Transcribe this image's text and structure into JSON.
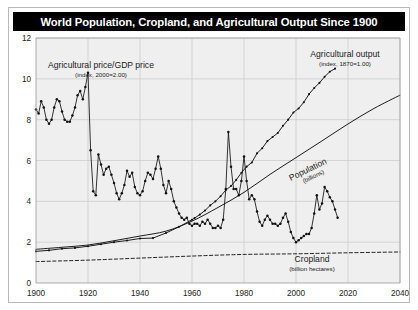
{
  "figure": {
    "title": "World Population, Cropland, and Agricultural Output Since 1900",
    "background": "#ffffff",
    "title_background": "#000000",
    "title_color": "#ffffff",
    "plot_background": "#efefef",
    "grid_color": "#c8c8c8",
    "axis_color": "#9a9a9a",
    "series_color": "#111111"
  },
  "annotations": {
    "price": {
      "line1": "Agricultural price/GDP price",
      "line2": "(index, 2000=2.00)"
    },
    "output": {
      "line1": "Agricultural output",
      "line2": "(index, 1870=1.00)"
    },
    "population": {
      "line1": "Population",
      "line2": "(billions)"
    },
    "cropland": {
      "line1": "Cropland",
      "line2": "(billion hectares)"
    }
  },
  "chart_data": {
    "type": "line",
    "title": "World Population, Cropland, and Agricultural Output Since 1900",
    "xlabel": "",
    "ylabel": "",
    "xlim": [
      1900,
      2040
    ],
    "ylim": [
      0,
      12
    ],
    "xticks": [
      1900,
      1920,
      1940,
      1960,
      1980,
      2000,
      2020,
      2040
    ],
    "yticks": [
      0,
      2,
      4,
      6,
      8,
      10,
      12
    ],
    "grid": true,
    "legend": "inline-annotations",
    "series": [
      {
        "name": "Agricultural price/GDP price",
        "units": "index, 2000=2.00",
        "style": "line-with-markers",
        "color": "#111111",
        "x": [
          1900,
          1901,
          1902,
          1903,
          1904,
          1905,
          1906,
          1907,
          1908,
          1909,
          1910,
          1911,
          1912,
          1913,
          1914,
          1915,
          1916,
          1917,
          1918,
          1919,
          1920,
          1921,
          1922,
          1923,
          1924,
          1925,
          1926,
          1927,
          1928,
          1929,
          1930,
          1931,
          1932,
          1933,
          1934,
          1935,
          1936,
          1937,
          1938,
          1939,
          1940,
          1941,
          1942,
          1943,
          1944,
          1945,
          1946,
          1947,
          1948,
          1949,
          1950,
          1951,
          1952,
          1953,
          1954,
          1955,
          1956,
          1957,
          1958,
          1959,
          1960,
          1961,
          1962,
          1963,
          1964,
          1965,
          1966,
          1967,
          1968,
          1969,
          1970,
          1971,
          1972,
          1973,
          1974,
          1975,
          1976,
          1977,
          1978,
          1979,
          1980,
          1981,
          1982,
          1983,
          1984,
          1985,
          1986,
          1987,
          1988,
          1989,
          1990,
          1991,
          1992,
          1993,
          1994,
          1995,
          1996,
          1997,
          1998,
          1999,
          2000,
          2001,
          2002,
          2003,
          2004,
          2005,
          2006,
          2007,
          2008,
          2009,
          2010,
          2011,
          2012,
          2013,
          2014,
          2015,
          2016
        ],
        "y": [
          8.5,
          8.3,
          8.9,
          8.6,
          8.0,
          7.8,
          8.0,
          8.6,
          9.0,
          8.9,
          8.4,
          8.0,
          7.9,
          7.9,
          8.2,
          8.6,
          9.2,
          9.4,
          9.0,
          9.6,
          10.3,
          6.5,
          4.5,
          4.3,
          6.3,
          5.8,
          5.3,
          5.6,
          5.7,
          5.3,
          4.9,
          4.4,
          4.1,
          4.4,
          4.8,
          5.5,
          5.2,
          5.4,
          4.7,
          4.4,
          4.3,
          4.5,
          5.0,
          5.4,
          5.3,
          5.1,
          5.6,
          6.2,
          5.6,
          4.8,
          4.4,
          5.0,
          4.6,
          4.0,
          3.7,
          3.4,
          3.2,
          3.1,
          3.2,
          2.9,
          2.8,
          2.9,
          2.9,
          2.8,
          3.0,
          2.9,
          3.1,
          2.9,
          2.7,
          2.7,
          2.8,
          2.7,
          3.1,
          4.6,
          7.4,
          5.7,
          4.6,
          4.6,
          4.3,
          5.0,
          6.2,
          5.0,
          4.1,
          4.3,
          4.1,
          3.5,
          3.0,
          2.8,
          3.1,
          3.3,
          3.1,
          2.9,
          2.9,
          2.8,
          2.9,
          3.2,
          3.4,
          3.0,
          2.5,
          2.2,
          2.0,
          2.1,
          2.2,
          2.3,
          2.4,
          2.4,
          2.7,
          3.4,
          4.3,
          3.6,
          3.9,
          4.7,
          4.5,
          4.2,
          4.0,
          3.6,
          3.2
        ]
      },
      {
        "name": "Agricultural output",
        "units": "index, 1870=1.00",
        "style": "line-with-small-markers",
        "color": "#111111",
        "x": [
          1900,
          1905,
          1910,
          1915,
          1920,
          1925,
          1930,
          1935,
          1940,
          1945,
          1950,
          1955,
          1960,
          1961,
          1963,
          1965,
          1967,
          1969,
          1971,
          1973,
          1975,
          1977,
          1979,
          1981,
          1983,
          1985,
          1987,
          1989,
          1991,
          1993,
          1995,
          1997,
          1999,
          2001,
          2003,
          2005,
          2007,
          2009,
          2011,
          2013,
          2015
        ],
        "y": [
          1.55,
          1.6,
          1.68,
          1.72,
          1.8,
          1.9,
          2.0,
          2.08,
          2.18,
          2.2,
          2.45,
          2.75,
          3.1,
          3.18,
          3.35,
          3.55,
          3.8,
          4.0,
          4.25,
          4.55,
          4.75,
          5.05,
          5.4,
          5.7,
          5.9,
          6.35,
          6.6,
          6.95,
          7.15,
          7.35,
          7.7,
          8.0,
          8.35,
          8.55,
          8.85,
          9.25,
          9.55,
          9.8,
          10.1,
          10.35,
          10.5
        ]
      },
      {
        "name": "Population",
        "units": "billions",
        "style": "smooth-line",
        "color": "#111111",
        "x": [
          1900,
          1910,
          1920,
          1930,
          1940,
          1950,
          1960,
          1970,
          1980,
          1990,
          2000,
          2010,
          2020,
          2030,
          2040
        ],
        "y": [
          1.65,
          1.75,
          1.86,
          2.07,
          2.3,
          2.54,
          3.03,
          3.7,
          4.44,
          5.32,
          6.14,
          6.96,
          7.79,
          8.55,
          9.2
        ]
      },
      {
        "name": "Cropland",
        "units": "billion hectares",
        "style": "dashed-line",
        "color": "#111111",
        "x": [
          1900,
          1920,
          1940,
          1960,
          1980,
          2000,
          2020,
          2040
        ],
        "y": [
          1.05,
          1.12,
          1.22,
          1.32,
          1.4,
          1.43,
          1.48,
          1.52
        ]
      }
    ]
  }
}
